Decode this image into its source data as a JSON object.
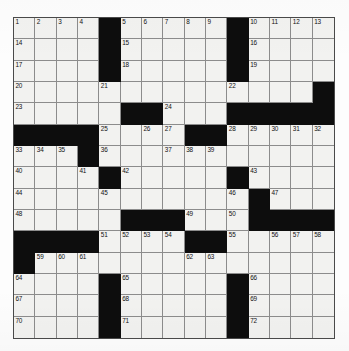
{
  "puzzle": {
    "type": "crossword-grid",
    "rows": 15,
    "columns": 15,
    "colors": {
      "block": "#0d0d0d",
      "open": "#f2f2f0",
      "grid_line": "#8c8c8c",
      "border": "#4a4a4a",
      "number_text": "#111111",
      "page_background": "#ffffff"
    },
    "blocks": [
      [
        0,
        4
      ],
      [
        0,
        10
      ],
      [
        1,
        4
      ],
      [
        1,
        10
      ],
      [
        2,
        4
      ],
      [
        2,
        10
      ],
      [
        3,
        14
      ],
      [
        4,
        5
      ],
      [
        4,
        6
      ],
      [
        4,
        10
      ],
      [
        4,
        11
      ],
      [
        4,
        12
      ],
      [
        4,
        13
      ],
      [
        4,
        14
      ],
      [
        5,
        0
      ],
      [
        5,
        1
      ],
      [
        5,
        2
      ],
      [
        5,
        3
      ],
      [
        5,
        8
      ],
      [
        5,
        9
      ],
      [
        6,
        3
      ],
      [
        7,
        4
      ],
      [
        7,
        10
      ],
      [
        8,
        11
      ],
      [
        9,
        5
      ],
      [
        9,
        6
      ],
      [
        9,
        7
      ],
      [
        9,
        11
      ],
      [
        9,
        12
      ],
      [
        9,
        13
      ],
      [
        9,
        14
      ],
      [
        10,
        0
      ],
      [
        10,
        1
      ],
      [
        10,
        2
      ],
      [
        10,
        3
      ],
      [
        10,
        8
      ],
      [
        10,
        9
      ],
      [
        11,
        0
      ],
      [
        12,
        4
      ],
      [
        12,
        10
      ],
      [
        13,
        4
      ],
      [
        13,
        10
      ],
      [
        14,
        4
      ],
      [
        14,
        10
      ]
    ],
    "numbers": [
      {
        "row": 0,
        "col": 0,
        "n": "1"
      },
      {
        "row": 0,
        "col": 1,
        "n": "2"
      },
      {
        "row": 0,
        "col": 2,
        "n": "3"
      },
      {
        "row": 0,
        "col": 3,
        "n": "4"
      },
      {
        "row": 0,
        "col": 5,
        "n": "5"
      },
      {
        "row": 0,
        "col": 6,
        "n": "6"
      },
      {
        "row": 0,
        "col": 7,
        "n": "7"
      },
      {
        "row": 0,
        "col": 8,
        "n": "8"
      },
      {
        "row": 0,
        "col": 9,
        "n": "9"
      },
      {
        "row": 0,
        "col": 11,
        "n": "10"
      },
      {
        "row": 0,
        "col": 12,
        "n": "11"
      },
      {
        "row": 0,
        "col": 13,
        "n": "12"
      },
      {
        "row": 0,
        "col": 14,
        "n": "13"
      },
      {
        "row": 1,
        "col": 0,
        "n": "14"
      },
      {
        "row": 1,
        "col": 5,
        "n": "15"
      },
      {
        "row": 1,
        "col": 11,
        "n": "16"
      },
      {
        "row": 2,
        "col": 0,
        "n": "17"
      },
      {
        "row": 2,
        "col": 5,
        "n": "18"
      },
      {
        "row": 2,
        "col": 11,
        "n": "19"
      },
      {
        "row": 3,
        "col": 0,
        "n": "20"
      },
      {
        "row": 3,
        "col": 4,
        "n": "21"
      },
      {
        "row": 3,
        "col": 10,
        "n": "22"
      },
      {
        "row": 4,
        "col": 0,
        "n": "23"
      },
      {
        "row": 4,
        "col": 7,
        "n": "24"
      },
      {
        "row": 5,
        "col": 4,
        "n": "25"
      },
      {
        "row": 5,
        "col": 6,
        "n": "26"
      },
      {
        "row": 5,
        "col": 7,
        "n": "27"
      },
      {
        "row": 5,
        "col": 10,
        "n": "28"
      },
      {
        "row": 5,
        "col": 11,
        "n": "29"
      },
      {
        "row": 5,
        "col": 12,
        "n": "30"
      },
      {
        "row": 5,
        "col": 13,
        "n": "31"
      },
      {
        "row": 5,
        "col": 14,
        "n": "32"
      },
      {
        "row": 6,
        "col": 0,
        "n": "33"
      },
      {
        "row": 6,
        "col": 1,
        "n": "34"
      },
      {
        "row": 6,
        "col": 2,
        "n": "35"
      },
      {
        "row": 6,
        "col": 4,
        "n": "36"
      },
      {
        "row": 6,
        "col": 7,
        "n": "37"
      },
      {
        "row": 6,
        "col": 8,
        "n": "38"
      },
      {
        "row": 6,
        "col": 9,
        "n": "39"
      },
      {
        "row": 7,
        "col": 0,
        "n": "40"
      },
      {
        "row": 7,
        "col": 3,
        "n": "41"
      },
      {
        "row": 7,
        "col": 5,
        "n": "42"
      },
      {
        "row": 7,
        "col": 11,
        "n": "43"
      },
      {
        "row": 8,
        "col": 0,
        "n": "44"
      },
      {
        "row": 8,
        "col": 4,
        "n": "45"
      },
      {
        "row": 8,
        "col": 10,
        "n": "46"
      },
      {
        "row": 8,
        "col": 12,
        "n": "47"
      },
      {
        "row": 9,
        "col": 0,
        "n": "48"
      },
      {
        "row": 9,
        "col": 8,
        "n": "49"
      },
      {
        "row": 9,
        "col": 10,
        "n": "50"
      },
      {
        "row": 10,
        "col": 4,
        "n": "51"
      },
      {
        "row": 10,
        "col": 5,
        "n": "52"
      },
      {
        "row": 10,
        "col": 6,
        "n": "53"
      },
      {
        "row": 10,
        "col": 7,
        "n": "54"
      },
      {
        "row": 10,
        "col": 10,
        "n": "55"
      },
      {
        "row": 10,
        "col": 12,
        "n": "56"
      },
      {
        "row": 10,
        "col": 13,
        "n": "57"
      },
      {
        "row": 10,
        "col": 14,
        "n": "58"
      },
      {
        "row": 11,
        "col": 1,
        "n": "59"
      },
      {
        "row": 11,
        "col": 2,
        "n": "60"
      },
      {
        "row": 11,
        "col": 3,
        "n": "61"
      },
      {
        "row": 11,
        "col": 8,
        "n": "62"
      },
      {
        "row": 11,
        "col": 9,
        "n": "63"
      },
      {
        "row": 12,
        "col": 0,
        "n": "64"
      },
      {
        "row": 12,
        "col": 5,
        "n": "65"
      },
      {
        "row": 12,
        "col": 11,
        "n": "66"
      },
      {
        "row": 13,
        "col": 0,
        "n": "67"
      },
      {
        "row": 13,
        "col": 5,
        "n": "68"
      },
      {
        "row": 13,
        "col": 11,
        "n": "69"
      },
      {
        "row": 14,
        "col": 0,
        "n": "70"
      },
      {
        "row": 14,
        "col": 5,
        "n": "71"
      },
      {
        "row": 14,
        "col": 11,
        "n": "72"
      }
    ],
    "letters": []
  }
}
